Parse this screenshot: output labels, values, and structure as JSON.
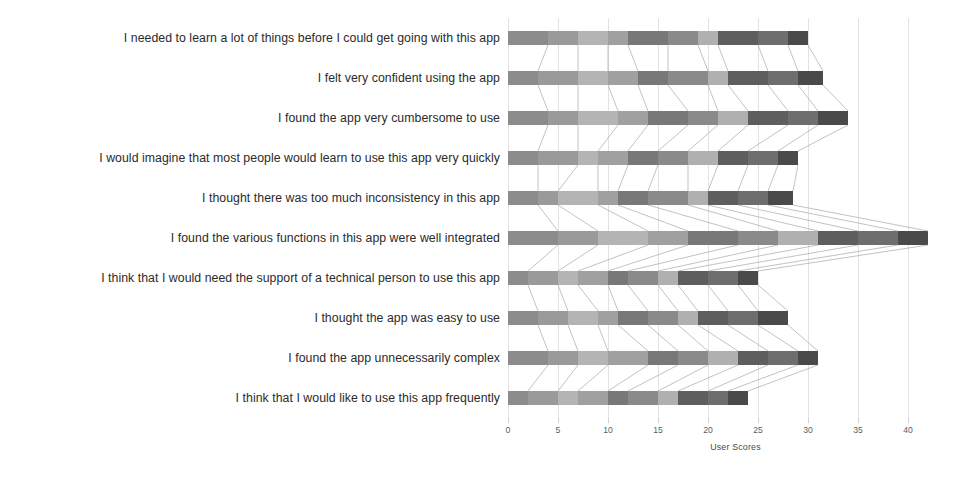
{
  "chart_data": {
    "type": "bar",
    "subtype": "stacked-horizontal",
    "title": "",
    "xlabel": "User Scores",
    "ylabel": "",
    "xlim": [
      0,
      45.5
    ],
    "grid": true,
    "legend": "none",
    "xticks": [
      0,
      5,
      10,
      15,
      20,
      25,
      30,
      35,
      40
    ],
    "xtick_labels": [
      "0",
      "5",
      "10",
      "15",
      "20",
      "25",
      "30",
      "35",
      "40"
    ],
    "categories": [
      "I needed to learn a lot of things before I could get going with this app",
      "I felt very confident using the app",
      "I found the app very cumbersome to use",
      "I would imagine that most people would learn to use this app very quickly",
      "I thought there was too much inconsistency in this app",
      "I found the various functions in this app were well integrated",
      "I think that I would need the support of a technical person to use this app",
      "I thought the app was easy to use",
      "I found the app unnecessarily complex",
      "I think that I would like to use this app frequently"
    ],
    "totals": [
      30,
      31.5,
      34,
      29,
      28.5,
      42,
      25,
      28,
      31,
      24
    ],
    "series": [
      {
        "name": "R1",
        "color": "#8c8c8c",
        "values": [
          4,
          3,
          4,
          3,
          3,
          5,
          2,
          3,
          4,
          2
        ]
      },
      {
        "name": "R2",
        "color": "#9a9a9a",
        "values": [
          3,
          4,
          3,
          4,
          2,
          4,
          3,
          3,
          3,
          3
        ]
      },
      {
        "name": "R3",
        "color": "#b4b4b4",
        "values": [
          3,
          3,
          4,
          2,
          4,
          5,
          2,
          3,
          3,
          2
        ]
      },
      {
        "name": "R4",
        "color": "#a0a0a0",
        "values": [
          2,
          3,
          3,
          3,
          2,
          4,
          3,
          2,
          4,
          3
        ]
      },
      {
        "name": "R5",
        "color": "#787878",
        "values": [
          4,
          3,
          4,
          3,
          3,
          5,
          2,
          3,
          3,
          2
        ]
      },
      {
        "name": "R6",
        "color": "#8a8a8a",
        "values": [
          3,
          4,
          3,
          3,
          4,
          4,
          3,
          3,
          3,
          3
        ]
      },
      {
        "name": "R7",
        "color": "#b0b0b0",
        "values": [
          2,
          2,
          3,
          3,
          2,
          4,
          2,
          2,
          3,
          2
        ]
      },
      {
        "name": "R8",
        "color": "#5e5e5e",
        "values": [
          4,
          4,
          4,
          3,
          3,
          4,
          3,
          3,
          3,
          3
        ]
      },
      {
        "name": "R9",
        "color": "#6e6e6e",
        "values": [
          3,
          3,
          3,
          3,
          3,
          4,
          3,
          3,
          3,
          2
        ]
      },
      {
        "name": "R10",
        "color": "#4a4a4a",
        "values": [
          2,
          2.5,
          3,
          2,
          2.5,
          3,
          2,
          3,
          2,
          2
        ]
      }
    ]
  },
  "axis": {
    "x_title": "User Scores"
  },
  "style": {
    "grid_color": "#e2e2e2",
    "connector_color": "#a8a8a8",
    "label_color": "#2b2b2b",
    "tick_color": "#5c5c5c",
    "background": "#ffffff"
  }
}
